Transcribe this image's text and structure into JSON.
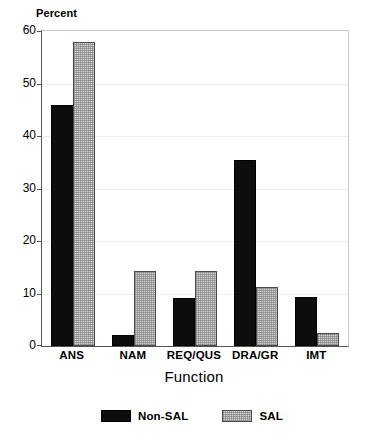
{
  "chart_data": {
    "type": "bar",
    "title": "",
    "xlabel": "Function",
    "ylabel": "Percent",
    "ylim": [
      0,
      60
    ],
    "yticks": [
      0,
      10,
      20,
      30,
      40,
      50,
      60
    ],
    "grid": true,
    "legend_position": "bottom",
    "categories": [
      "ANS",
      "NAM",
      "REQ/QUS",
      "DRA/GR",
      "IMT"
    ],
    "series": [
      {
        "name": "Non-SAL",
        "color": "#0d0d0d",
        "values": [
          46.0,
          2.1,
          9.2,
          35.4,
          9.4
        ]
      },
      {
        "name": "SAL",
        "color": "#d2d2d2",
        "values": [
          58.0,
          14.2,
          14.2,
          11.3,
          2.5
        ]
      }
    ]
  },
  "axis": {
    "y_title": "Percent",
    "x_title": "Function",
    "tick_labels": [
      "0",
      "10",
      "20",
      "30",
      "40",
      "50",
      "60"
    ]
  },
  "legend": {
    "entries": [
      {
        "label": "Non-SAL"
      },
      {
        "label": "SAL"
      }
    ]
  }
}
